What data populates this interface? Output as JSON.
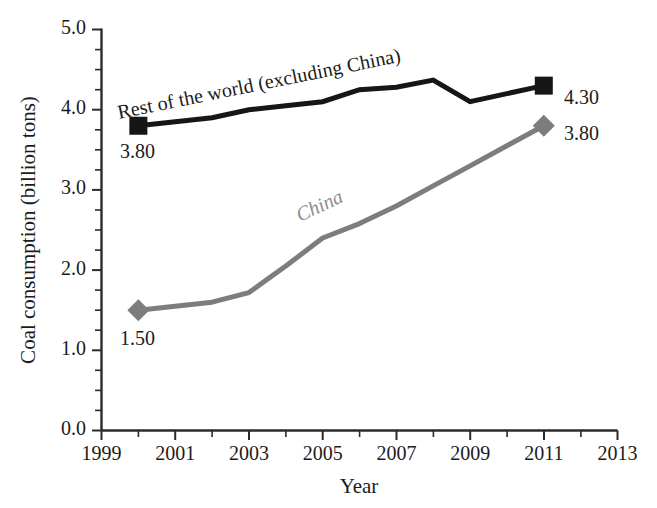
{
  "chart_data": {
    "type": "line",
    "title": "",
    "xlabel": "Year",
    "ylabel": "Coal consumption (billion tons)",
    "xlim": [
      1999,
      2013
    ],
    "ylim": [
      0.0,
      5.0
    ],
    "grid": false,
    "legend_position": "inline-annotation",
    "x_ticks": [
      1999,
      2000,
      2001,
      2002,
      2003,
      2004,
      2005,
      2006,
      2007,
      2008,
      2009,
      2010,
      2011,
      2012,
      2013
    ],
    "x_tick_labels": [
      "1999",
      "",
      "2001",
      "",
      "2003",
      "",
      "2005",
      "",
      "2007",
      "",
      "2009",
      "",
      "2011",
      "",
      "2013"
    ],
    "y_ticks": [
      0.0,
      1.0,
      2.0,
      3.0,
      4.0,
      5.0
    ],
    "y_tick_labels": [
      "0.0",
      "1.0",
      "2.0",
      "3.0",
      "4.0",
      "5.0"
    ],
    "y_minor_step": 0.25,
    "series": [
      {
        "name": "Rest of the world (excluding China)",
        "color": "#161616",
        "marker": "square",
        "annotation": "Rest of the world (excluding China)",
        "x": [
          2000,
          2001,
          2002,
          2003,
          2004,
          2005,
          2006,
          2007,
          2008,
          2009,
          2010,
          2011
        ],
        "values": [
          3.8,
          3.85,
          3.9,
          4.0,
          4.05,
          4.1,
          4.25,
          4.28,
          4.37,
          4.1,
          4.2,
          4.3
        ],
        "endpoint_labels": [
          {
            "x": 2000,
            "value": 3.8,
            "text": "3.80",
            "position": "below-left"
          },
          {
            "x": 2011,
            "value": 4.3,
            "text": "4.30",
            "position": "right"
          }
        ]
      },
      {
        "name": "China",
        "color": "#7d7d7d",
        "marker": "diamond",
        "annotation": "China",
        "x": [
          2000,
          2001,
          2002,
          2003,
          2004,
          2005,
          2006,
          2007,
          2008,
          2009,
          2010,
          2011
        ],
        "values": [
          1.5,
          1.55,
          1.6,
          1.72,
          2.05,
          2.4,
          2.58,
          2.8,
          3.05,
          3.3,
          3.55,
          3.8
        ],
        "endpoint_labels": [
          {
            "x": 2000,
            "value": 1.5,
            "text": "1.50",
            "position": "below-left"
          },
          {
            "x": 2011,
            "value": 3.8,
            "text": "3.80",
            "position": "right"
          }
        ]
      }
    ]
  },
  "labels": {
    "y_axis_title": "Coal consumption (billion tons)",
    "x_axis_title": "Year",
    "annot_world": "Rest of the world (excluding China)",
    "annot_china": "China",
    "world_start_value": "3.80",
    "world_end_value": "4.30",
    "china_start_value": "1.50",
    "china_end_value": "3.80",
    "y0": "0.0",
    "y1": "1.0",
    "y2": "2.0",
    "y3": "3.0",
    "y4": "4.0",
    "y5": "5.0",
    "x1999": "1999",
    "x2001": "2001",
    "x2003": "2003",
    "x2005": "2005",
    "x2007": "2007",
    "x2009": "2009",
    "x2011": "2011",
    "x2013": "2013"
  },
  "colors": {
    "world": "#161616",
    "china": "#7d7d7d",
    "axis": "#2b2b2b",
    "text": "#1b1b1b",
    "background": "#ffffff"
  }
}
